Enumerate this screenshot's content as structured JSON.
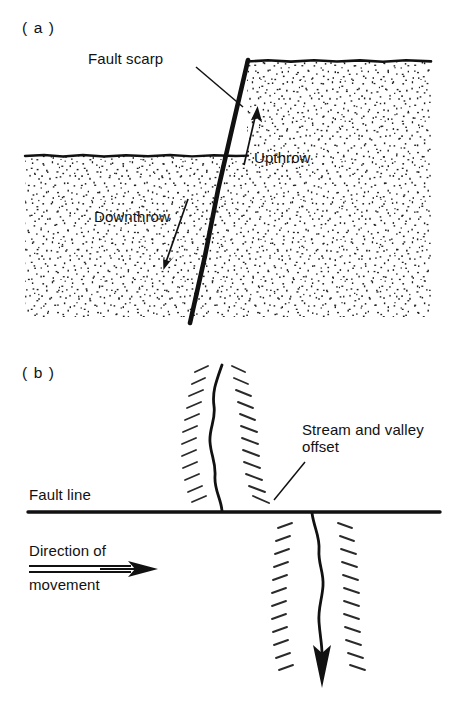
{
  "figure": {
    "ink_color": "#111111",
    "background_color": "#ffffff",
    "width": 455,
    "height": 701
  },
  "panel_a": {
    "label": "( a )",
    "kind": "dip-slip-fault-cross-section",
    "labels": {
      "fault_scarp": "Fault scarp",
      "upthrow": "Upthrow",
      "downthrow": "Downthrow"
    }
  },
  "panel_b": {
    "label": "( b )",
    "kind": "strike-slip-fault-map-view",
    "labels": {
      "fault_line": "Fault line",
      "stream_offset_line1": "Stream and valley",
      "stream_offset_line2": "offset",
      "direction_line1": "Direction of",
      "direction_line2": "movement"
    }
  },
  "caption": {
    "visible_fragment": ""
  }
}
